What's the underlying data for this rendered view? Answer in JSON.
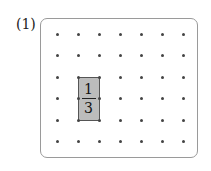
{
  "problem_label": "(1)",
  "grid": {
    "cols": 7,
    "rows": 6,
    "x_positions": [
      57,
      78,
      99,
      120,
      141,
      162,
      183
    ],
    "y_positions": [
      34,
      55,
      77,
      98,
      120,
      141
    ]
  },
  "shaded_region": {
    "col_start": 1,
    "col_end": 2,
    "row_start": 2,
    "row_end": 4,
    "fill": "#bcbcbc"
  },
  "fraction": {
    "numerator": "1",
    "denominator": "3"
  }
}
